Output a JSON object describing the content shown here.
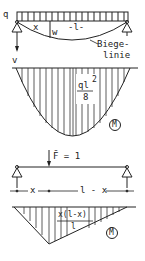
{
  "beam_top": {
    "load_label": "q",
    "x_label": "x",
    "w_label": "w",
    "length_label": "-l-",
    "deflection_label_line1": "Biege-",
    "deflection_label_line2": "linie",
    "v_label": "v"
  },
  "moment_diagram": {
    "max_numerator": "ql",
    "max_exponent": "2",
    "max_denominator": "8",
    "symbol": "M"
  },
  "beam_unit": {
    "force_label": "F̄ = 1",
    "x_dim": "x",
    "rest_dim": "l - x"
  },
  "unit_moment_diagram": {
    "max_numerator": "x(l-x)",
    "max_denominator": "l",
    "symbol": "M̄"
  },
  "colors": {
    "line": "#222222",
    "background": "#ffffff"
  }
}
